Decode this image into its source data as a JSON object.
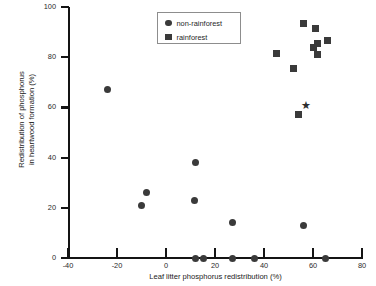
{
  "chart_data": {
    "type": "scatter",
    "title": "",
    "xlabel": "Leaf litter phosphorus redistribution (%)",
    "ylabel_line1": "Redistribution of phosphorus",
    "ylabel_line2": "in heartwood formation (%)",
    "xlim": [
      -40,
      80
    ],
    "ylim": [
      0,
      100
    ],
    "xticks": [
      -40,
      -20,
      0,
      20,
      40,
      60,
      80
    ],
    "xticklabels": [
      "-40",
      "-20",
      "0",
      "20",
      "40",
      "60",
      "80"
    ],
    "yticks": [
      0,
      20,
      40,
      60,
      80,
      100
    ],
    "yticklabels": [
      "0",
      "20",
      "40",
      "60",
      "80",
      "100"
    ],
    "grid": false,
    "legend_position": "top-center",
    "marker_color": "#3a3a3a",
    "series": [
      {
        "name": "non-rainforest",
        "marker": "circle",
        "points": [
          [
            -24,
            67
          ],
          [
            -10,
            21
          ],
          [
            -8,
            26
          ],
          [
            11.5,
            23
          ],
          [
            12,
            38
          ],
          [
            12,
            0
          ],
          [
            15.5,
            0
          ],
          [
            27,
            14
          ],
          [
            27,
            0
          ],
          [
            36,
            0
          ],
          [
            56,
            13
          ],
          [
            65,
            0
          ]
        ]
      },
      {
        "name": "rainforest",
        "marker": "square",
        "points": [
          [
            45,
            81.5
          ],
          [
            52,
            75.5
          ],
          [
            54,
            57
          ],
          [
            56,
            93.5
          ],
          [
            60,
            84
          ],
          [
            61,
            91.5
          ],
          [
            62,
            85.5
          ],
          [
            62,
            81
          ],
          [
            66,
            86.5
          ]
        ]
      },
      {
        "name": "star-marker",
        "marker": "star",
        "glyph": "★",
        "points": [
          [
            57,
            60.5
          ]
        ]
      }
    ]
  },
  "legend": {
    "items": [
      {
        "label": "non-rainforest",
        "marker": "circle"
      },
      {
        "label": "rainforest",
        "marker": "square"
      }
    ]
  }
}
